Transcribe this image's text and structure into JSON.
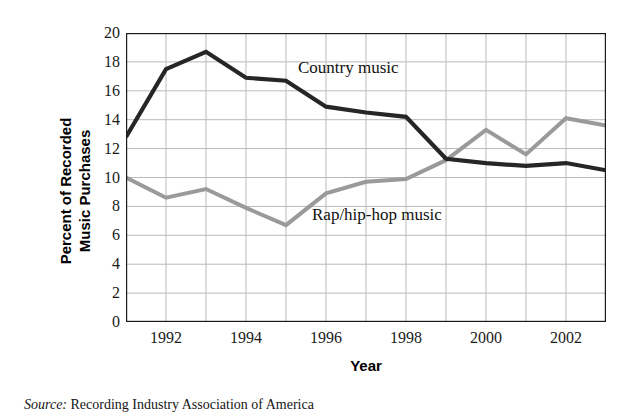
{
  "chart_data": {
    "type": "line",
    "title": "",
    "xlabel": "Year",
    "ylabel": "Percent of Recorded\nMusic Purchases",
    "x": [
      1991,
      1992,
      1993,
      1994,
      1995,
      1996,
      1997,
      1998,
      1999,
      2000,
      2001,
      2002,
      2003
    ],
    "xlim": [
      1991,
      2003
    ],
    "ylim": [
      0,
      20
    ],
    "ytick_labels": [
      "0",
      "2",
      "4",
      "6",
      "8",
      "10",
      "12",
      "14",
      "16",
      "18",
      "20"
    ],
    "ytick_values": [
      0,
      2,
      4,
      6,
      8,
      10,
      12,
      14,
      16,
      18,
      20
    ],
    "xtick_labels": [
      "1992",
      "1994",
      "1996",
      "1998",
      "2000",
      "2002"
    ],
    "xtick_values": [
      1992,
      1994,
      1996,
      1998,
      2000,
      2002
    ],
    "grid": true,
    "grid_x_every": 1,
    "grid_y_every": 2,
    "legend_position": "inline-annotations",
    "series": [
      {
        "name": "Country music",
        "color": "#262626",
        "values": [
          12.8,
          17.5,
          18.7,
          16.9,
          16.7,
          14.9,
          14.5,
          14.2,
          11.3,
          11.0,
          10.8,
          11.0,
          10.5
        ]
      },
      {
        "name": "Rap/hip-hop music",
        "color": "#9a9a9a",
        "values": [
          10.0,
          8.6,
          9.2,
          7.9,
          6.7,
          8.9,
          9.7,
          9.9,
          11.2,
          13.3,
          11.6,
          14.1,
          13.6
        ]
      }
    ],
    "annotations": [
      {
        "text": "Country music",
        "series": "Country music"
      },
      {
        "text": "Rap/hip-hop music",
        "series": "Rap/hip-hop music"
      }
    ]
  },
  "source": {
    "label": "Source:",
    "text": "Recording Industry Association of America"
  },
  "colors": {
    "country_line": "#262626",
    "rap_line": "#9a9a9a",
    "axis": "#1a1a1a",
    "grid": "#b9b9b9",
    "background": "#ffffff"
  }
}
